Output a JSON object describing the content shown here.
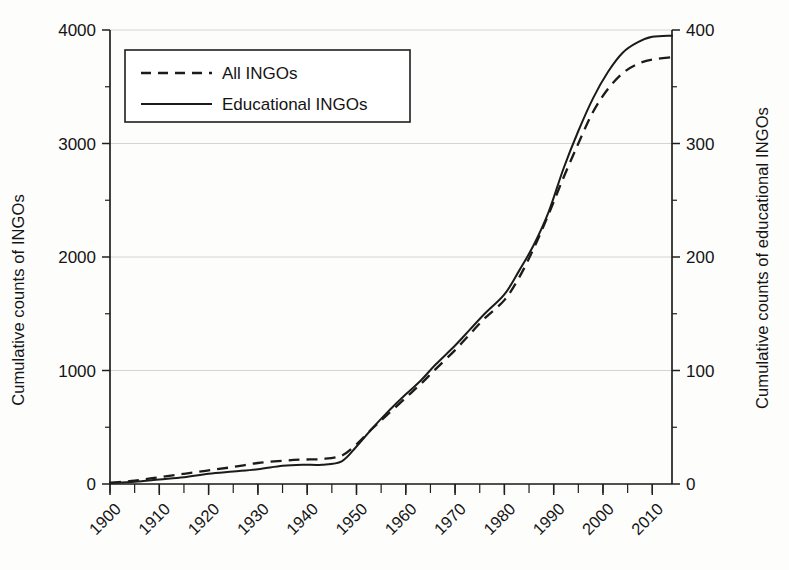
{
  "chart_data": {
    "type": "line",
    "title": "",
    "xlabel": "",
    "ylabel": "Cumulative counts of INGOs",
    "y2label": "Cumulative counts of educational INGOs",
    "xlim": [
      1900,
      2014
    ],
    "ylim": [
      0,
      4000
    ],
    "y2lim": [
      0,
      400
    ],
    "grid": true,
    "legend_position": "top-left",
    "yticks": [
      0,
      1000,
      2000,
      3000,
      4000
    ],
    "ytick_labels": [
      "0",
      "1000",
      "2000",
      "3000",
      "4000"
    ],
    "y2ticks": [
      0,
      100,
      200,
      300,
      400
    ],
    "y2tick_labels": [
      "0",
      "100",
      "200",
      "300",
      "400"
    ],
    "xticks": [
      1900,
      1910,
      1920,
      1930,
      1940,
      1950,
      1960,
      1970,
      1980,
      1990,
      2000,
      2010
    ],
    "xtick_labels": [
      "1900",
      "1910",
      "1920",
      "1930",
      "1940",
      "1950",
      "1960",
      "1970",
      "1980",
      "1990",
      "2000",
      "2010"
    ],
    "xtick_minor_step": 5,
    "x": [
      1900,
      1905,
      1910,
      1915,
      1920,
      1925,
      1930,
      1935,
      1939,
      1943,
      1947,
      1950,
      1953,
      1956,
      1960,
      1963,
      1966,
      1970,
      1973,
      1976,
      1980,
      1983,
      1986,
      1989,
      1992,
      1995,
      1998,
      2001,
      2004,
      2007,
      2010,
      2014
    ],
    "series": [
      {
        "name": "All INGOs",
        "style": "dashed",
        "axis": "left",
        "values": [
          10,
          30,
          60,
          90,
          120,
          150,
          185,
          205,
          215,
          220,
          250,
          350,
          480,
          600,
          760,
          880,
          1010,
          1180,
          1320,
          1460,
          1620,
          1820,
          2080,
          2380,
          2700,
          3000,
          3280,
          3480,
          3620,
          3700,
          3740,
          3760
        ]
      },
      {
        "name": "Educational INGOs",
        "style": "solid",
        "axis": "right",
        "values": [
          1,
          2,
          4,
          6,
          9,
          11,
          13,
          16,
          17,
          17,
          20,
          33,
          48,
          62,
          79,
          91,
          105,
          122,
          136,
          150,
          167,
          188,
          211,
          240,
          278,
          311,
          340,
          363,
          380,
          389,
          394,
          395
        ]
      }
    ]
  },
  "legend": {
    "entries": [
      {
        "label": "All INGOs",
        "style": "dashed"
      },
      {
        "label": "Educational INGOs",
        "style": "solid"
      }
    ]
  }
}
